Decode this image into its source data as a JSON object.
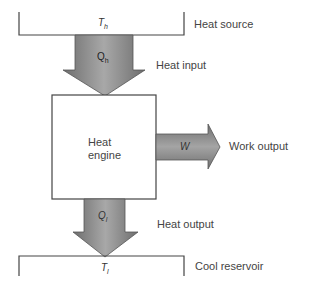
{
  "diagram": {
    "heat_source": {
      "label": "Heat source",
      "symbol": "T_h",
      "symbol_main": "T",
      "symbol_sub": "h"
    },
    "heat_input": {
      "label": "Heat input",
      "symbol_main": "Q",
      "symbol_sub": "h"
    },
    "engine": {
      "line1": "Heat",
      "line2": "engine"
    },
    "work_output": {
      "label": "Work output",
      "symbol": "W"
    },
    "heat_output": {
      "label": "Heat output",
      "symbol_main": "Q",
      "symbol_sub": "l"
    },
    "cool_reservoir": {
      "label": "Cool reservoir",
      "symbol_main": "T",
      "symbol_sub": "l"
    }
  },
  "colors": {
    "arrow_fill": "#8a8a8a",
    "arrow_dark": "#5a5a5a",
    "line": "#444444"
  }
}
